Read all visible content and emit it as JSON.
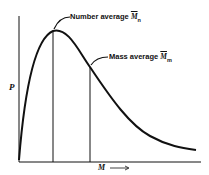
{
  "diagram": {
    "y_axis_label": "P",
    "x_axis_label": "M",
    "x_axis_arrow": "⟶",
    "annotations": [
      {
        "text": "Number average",
        "symbol": "M",
        "subscript": "n"
      },
      {
        "text": "Mass average",
        "symbol": "M",
        "subscript": "m"
      }
    ],
    "curve": "molecular mass distribution (skewed right)",
    "colors": {
      "ink": "#111111",
      "background": "#ffffff"
    }
  }
}
